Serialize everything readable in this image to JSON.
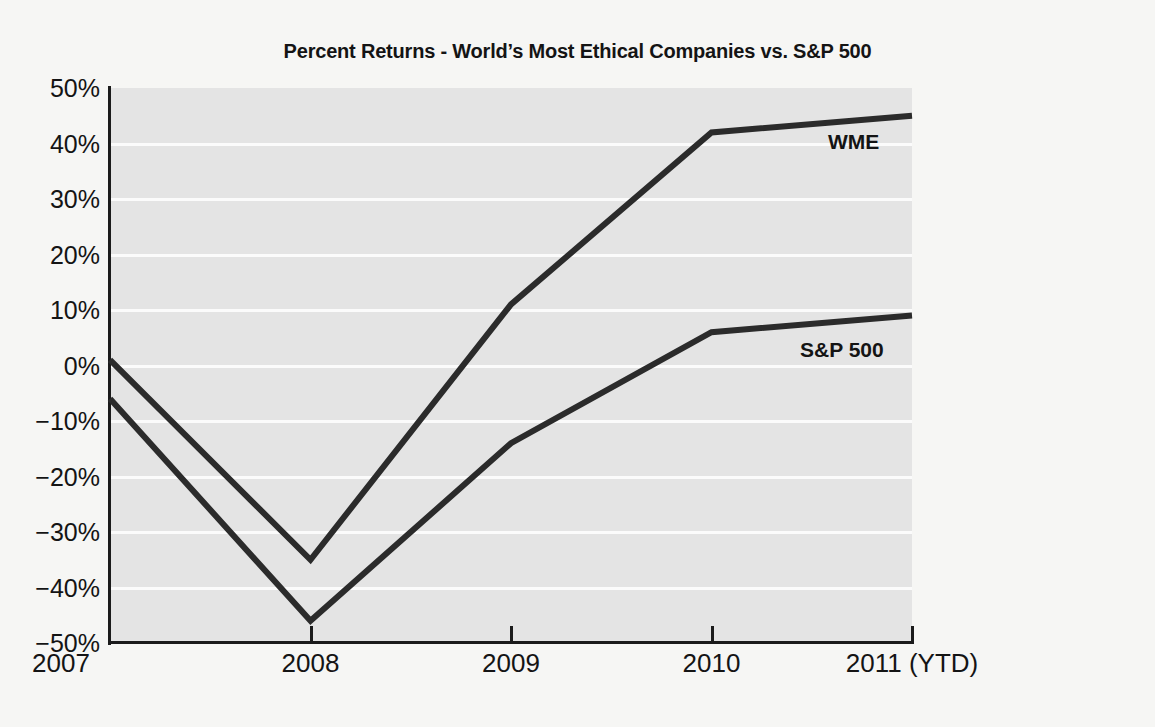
{
  "chart_data": {
    "type": "line",
    "title": "Percent Returns - World’s Most Ethical Companies vs. S&P 500",
    "xlabel": "",
    "ylabel": "",
    "categories": [
      "2007",
      "2008",
      "2009",
      "2010",
      "2011 (YTD)"
    ],
    "x_tick_labels": [
      "2007",
      "2008",
      "2009",
      "2010",
      "2011 (YTD)"
    ],
    "y_tick_labels": [
      "50%",
      "40%",
      "30%",
      "20%",
      "10%",
      "0%",
      "−10%",
      "−20%",
      "−30%",
      "−40%",
      "−50%"
    ],
    "y_tick_values": [
      50,
      40,
      30,
      20,
      10,
      0,
      -10,
      -20,
      -30,
      -40,
      -50
    ],
    "ylim": [
      -50,
      50
    ],
    "y_unit": "%",
    "grid": "horizontal",
    "legend_position": "inline-right",
    "series": [
      {
        "name": "WME",
        "label": "WME",
        "color": "#2b2b2b",
        "values": [
          1,
          -35,
          11,
          42,
          45
        ]
      },
      {
        "name": "S&P 500",
        "label": "S&P 500",
        "color": "#2b2b2b",
        "values": [
          -6,
          -46,
          -14,
          6,
          9
        ]
      }
    ],
    "annotations": [
      {
        "text": "WME",
        "series": "WME"
      },
      {
        "text": "S&P 500",
        "series": "S&P 500"
      }
    ],
    "colors": {
      "background": "#f6f6f4",
      "plot_background": "#e4e4e4",
      "gridline": "#fbfbfb",
      "axis": "#1b1b1b",
      "line": "#2b2b2b",
      "text": "#141414"
    }
  }
}
